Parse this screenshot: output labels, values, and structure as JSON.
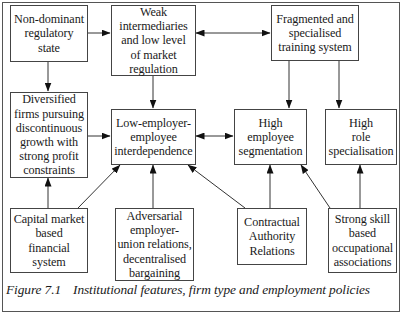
{
  "diagram": {
    "nodes": [
      {
        "id": "non-dominant-regulatory-state",
        "label": "Non-dominant\nregulatory\nstate"
      },
      {
        "id": "weak-intermediaries",
        "label": "Weak\nintermediaries\nand low level\nof market\nregulation"
      },
      {
        "id": "fragmented-training-system",
        "label": "Fragmented and\nspecialised\ntraining system"
      },
      {
        "id": "diversified-firms",
        "label": "Diversified\nfirms pursuing\ndiscontinuous\ngrowth with\nstrong profit\nconstraints"
      },
      {
        "id": "low-interdependence",
        "label": "Low-employer-\nemployee\ninterdependence"
      },
      {
        "id": "high-employee-segmentation",
        "label": "High\nemployee\nsegmentation"
      },
      {
        "id": "high-role-specialisation",
        "label": "High\nrole\nspecialisation"
      },
      {
        "id": "capital-market-financial-system",
        "label": "Capital market\nbased\nfinancial\nsystem"
      },
      {
        "id": "adversarial-relations",
        "label": "Adversarial\nemployer-\nunion relations,\ndecentralised\nbargaining"
      },
      {
        "id": "contractual-authority-relations",
        "label": "Contractual\nAuthority\nRelations"
      },
      {
        "id": "strong-skill-associations",
        "label": "Strong skill\nbased\noccupational\nassociations"
      }
    ],
    "edges": [
      {
        "from": "non-dominant-regulatory-state",
        "to": "weak-intermediaries",
        "type": "arrow"
      },
      {
        "from": "non-dominant-regulatory-state",
        "to": "diversified-firms",
        "type": "arrow"
      },
      {
        "from": "weak-intermediaries",
        "to": "fragmented-training-system",
        "type": "bidirectional"
      },
      {
        "from": "weak-intermediaries",
        "to": "low-interdependence",
        "type": "arrow"
      },
      {
        "from": "fragmented-training-system",
        "to": "high-employee-segmentation",
        "type": "arrow"
      },
      {
        "from": "fragmented-training-system",
        "to": "high-role-specialisation",
        "type": "arrow"
      },
      {
        "from": "diversified-firms",
        "to": "low-interdependence",
        "type": "arrow"
      },
      {
        "from": "low-interdependence",
        "to": "high-employee-segmentation",
        "type": "bidirectional"
      },
      {
        "from": "capital-market-financial-system",
        "to": "diversified-firms",
        "type": "arrow"
      },
      {
        "from": "capital-market-financial-system",
        "to": "low-interdependence",
        "type": "arrow"
      },
      {
        "from": "adversarial-relations",
        "to": "low-interdependence",
        "type": "arrow"
      },
      {
        "from": "contractual-authority-relations",
        "to": "low-interdependence",
        "type": "arrow"
      },
      {
        "from": "contractual-authority-relations",
        "to": "high-employee-segmentation",
        "type": "arrow"
      },
      {
        "from": "strong-skill-associations",
        "to": "high-employee-segmentation",
        "type": "arrow"
      },
      {
        "from": "strong-skill-associations",
        "to": "high-role-specialisation",
        "type": "arrow"
      }
    ]
  },
  "caption": {
    "number": "Figure 7.1",
    "text": "Institutional features, firm type and employment policies"
  }
}
